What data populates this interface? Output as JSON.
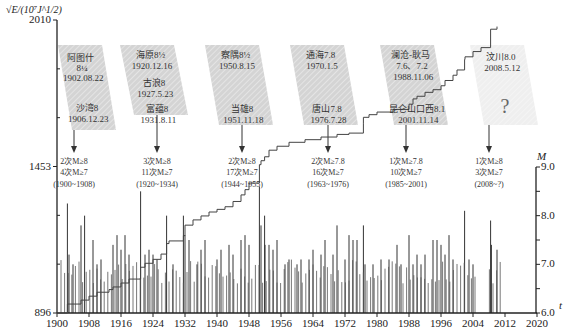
{
  "chart_data": {
    "type": "bar",
    "title": "",
    "xlabel": "t",
    "ylabel_left": "√E/(10^7 J^1/2)",
    "ylabel_right": "M",
    "x_range": [
      1900,
      2020
    ],
    "x_ticks": [
      "1900",
      "1908",
      "1916",
      "1924",
      "1932",
      "1940",
      "1948",
      "1956",
      "1964",
      "1972",
      "1980",
      "1988",
      "1996",
      "2004",
      "2012",
      "2020"
    ],
    "y_left_ticks": [
      "896",
      "1453",
      "2010"
    ],
    "y_left_range": [
      896,
      2010
    ],
    "y_right_ticks": [
      "6.0",
      "7.0",
      "8.0",
      "9.0"
    ],
    "y_right_range": [
      6.0,
      9.0
    ],
    "grid": false,
    "series": [
      {
        "name": "Cumulative Benioff strain (step line)",
        "type": "step",
        "points": [
          [
            1900,
            896
          ],
          [
            1902.6,
            905
          ],
          [
            1902.6,
            930
          ],
          [
            1906,
            945
          ],
          [
            1908,
            960
          ],
          [
            1910,
            975
          ],
          [
            1913,
            985
          ],
          [
            1914,
            995
          ],
          [
            1916,
            1010
          ],
          [
            1918,
            1025
          ],
          [
            1920.9,
            1070
          ],
          [
            1922,
            1085
          ],
          [
            1924,
            1100
          ],
          [
            1926,
            1120
          ],
          [
            1927.4,
            1160
          ],
          [
            1928,
            1170
          ],
          [
            1931.6,
            1190
          ],
          [
            1932,
            1230
          ],
          [
            1934,
            1250
          ],
          [
            1936,
            1265
          ],
          [
            1938,
            1280
          ],
          [
            1940,
            1290
          ],
          [
            1942,
            1300
          ],
          [
            1944,
            1320
          ],
          [
            1946,
            1345
          ],
          [
            1947,
            1365
          ],
          [
            1948,
            1390
          ],
          [
            1950.6,
            1460
          ],
          [
            1951,
            1475
          ],
          [
            1951.9,
            1490
          ],
          [
            1953,
            1515
          ],
          [
            1955,
            1530
          ],
          [
            1958,
            1545
          ],
          [
            1962,
            1555
          ],
          [
            1966,
            1565
          ],
          [
            1970,
            1575
          ],
          [
            1973,
            1580
          ],
          [
            1976.6,
            1615
          ],
          [
            1976.6,
            1640
          ],
          [
            1978,
            1650
          ],
          [
            1980,
            1660
          ],
          [
            1984,
            1670
          ],
          [
            1988,
            1690
          ],
          [
            1989,
            1710
          ],
          [
            1990,
            1720
          ],
          [
            1992,
            1735
          ],
          [
            1994,
            1745
          ],
          [
            1996,
            1760
          ],
          [
            1997,
            1780
          ],
          [
            1999,
            1800
          ],
          [
            2000,
            1820
          ],
          [
            2001.9,
            1860
          ],
          [
            2002,
            1870
          ],
          [
            2004,
            1890
          ],
          [
            2006,
            1905
          ],
          [
            2008.4,
            1975
          ],
          [
            2010,
            1985
          ]
        ]
      },
      {
        "name": "Earthquake magnitudes (M)",
        "type": "bar",
        "events": [
          [
            1902.6,
            8.25
          ],
          [
            1903,
            7.2
          ],
          [
            1904,
            7.0
          ],
          [
            1906,
            7.8
          ],
          [
            1906.9,
            8.0
          ],
          [
            1909,
            7.5
          ],
          [
            1910,
            7.0
          ],
          [
            1911,
            7.1
          ],
          [
            1914,
            7.4
          ],
          [
            1915,
            7.6
          ],
          [
            1916,
            7.3
          ],
          [
            1917,
            7.6
          ],
          [
            1918,
            7.2
          ],
          [
            1920.9,
            8.5
          ],
          [
            1922,
            7.2
          ],
          [
            1923,
            7.3
          ],
          [
            1924,
            7.2
          ],
          [
            1925,
            7.1
          ],
          [
            1927.4,
            8.0
          ],
          [
            1929,
            7.0
          ],
          [
            1931.6,
            8.0
          ],
          [
            1932,
            7.6
          ],
          [
            1933,
            7.5
          ],
          [
            1935,
            7.0
          ],
          [
            1936,
            7.3
          ],
          [
            1937,
            7.5
          ],
          [
            1940,
            7.1
          ],
          [
            1941,
            7.3
          ],
          [
            1943,
            7.4
          ],
          [
            1944,
            7.2
          ],
          [
            1946,
            7.5
          ],
          [
            1947,
            7.6
          ],
          [
            1948,
            7.4
          ],
          [
            1950.6,
            8.6
          ],
          [
            1951,
            7.8
          ],
          [
            1951.9,
            8.0
          ],
          [
            1952,
            7.4
          ],
          [
            1953,
            7.4
          ],
          [
            1954,
            7.3
          ],
          [
            1955,
            7.5
          ],
          [
            1957,
            7.0
          ],
          [
            1958,
            7.1
          ],
          [
            1960,
            7.0
          ],
          [
            1961,
            7.1
          ],
          [
            1963,
            7.1
          ],
          [
            1964,
            7.3
          ],
          [
            1966,
            7.2
          ],
          [
            1967,
            7.5
          ],
          [
            1969,
            7.2
          ],
          [
            1970,
            7.8
          ],
          [
            1972,
            7.1
          ],
          [
            1973,
            7.6
          ],
          [
            1974,
            7.5
          ],
          [
            1975,
            7.5
          ],
          [
            1976.6,
            7.8
          ],
          [
            1977,
            7.0
          ],
          [
            1979,
            7.0
          ],
          [
            1981,
            7.1
          ],
          [
            1983,
            7.1
          ],
          [
            1985,
            7.4
          ],
          [
            1986,
            7.0
          ],
          [
            1988,
            7.6
          ],
          [
            1989,
            7.0
          ],
          [
            1990,
            7.2
          ],
          [
            1991,
            7.0
          ],
          [
            1992,
            7.2
          ],
          [
            1994,
            7.5
          ],
          [
            1995,
            7.5
          ],
          [
            1996,
            7.4
          ],
          [
            1997,
            7.2
          ],
          [
            1998,
            7.6
          ],
          [
            1999,
            7.1
          ],
          [
            2001.9,
            8.1
          ],
          [
            2003,
            7.1
          ],
          [
            2004,
            7.0
          ],
          [
            2008.4,
            7.9
          ],
          [
            2008.6,
            7.4
          ],
          [
            2010,
            7.3
          ]
        ]
      }
    ],
    "annotations": {
      "upper_boxes": [
        {
          "lines": [
            "阿图什",
            "8¼",
            "1902.08.22",
            "",
            "沙湾8",
            "1906.12.23"
          ],
          "period_top": true
        },
        {
          "lines": [
            "海原8½",
            "1920.12.16",
            "古浪8",
            "1927.5.23",
            "富蕴8",
            "1931.8.11"
          ]
        },
        {
          "lines": [
            "察隅8½",
            "1950.8.15",
            "",
            "当雄8",
            "1951.11.18"
          ]
        },
        {
          "lines": [
            "通海7.8",
            "1970.1.5",
            "",
            "唐山7.8",
            "1976.7.28"
          ]
        },
        {
          "lines": [
            "澜沧-耿马",
            "7.6、7.2",
            "1988.11.06",
            "",
            "昆仑山口西8.1",
            "2001.11.14"
          ]
        },
        {
          "lines": [
            "汶川8.0",
            "2008.5.12",
            "",
            "?"
          ]
        }
      ],
      "period_summaries": [
        {
          "line1": "2次M≥8",
          "line2": "4次M≥7",
          "range": "(1900~1908)"
        },
        {
          "line1": "3次M≥8",
          "line2": "11次M≥7",
          "range": "(1920~1934)"
        },
        {
          "line1": "2次M≥8",
          "line2": "17次M≥7",
          "range": "(1944~1955)"
        },
        {
          "line1": "2次M≥7.8",
          "line2": "16次M≥7",
          "range": "(1963~1976)"
        },
        {
          "line1": "1次M≥7.8",
          "line2": "10次M≥7",
          "range": "(1985~2001)"
        },
        {
          "line1": "1次M≥8",
          "line2": "3次M≥7",
          "range": "(2008~?)"
        }
      ]
    }
  },
  "labels": {
    "y_left_title": "√E/(10⁷J^1/2)",
    "y_right_title": "M",
    "x_title": "t"
  }
}
